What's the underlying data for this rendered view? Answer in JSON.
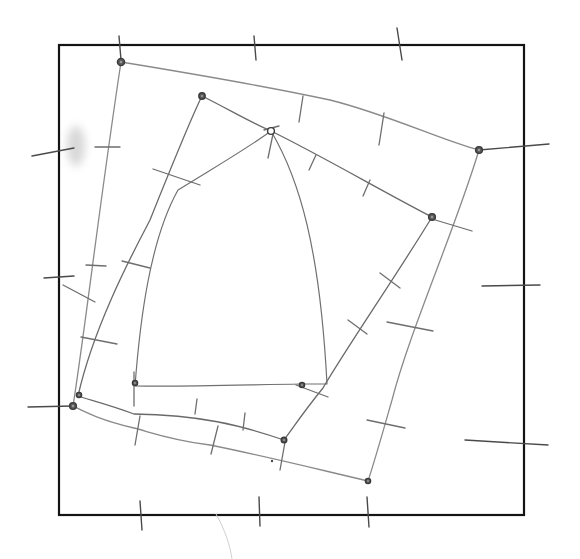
{
  "diagram": {
    "kind": "hand-drawn pencil sketch",
    "width": 580,
    "height": 559,
    "colors": {
      "background": "#ffffff",
      "frame": "#141414",
      "pencil_dark": "#4a4a4a",
      "pencil_mid": "#6e6e6e",
      "pencil_light": "#9a9a9a",
      "vertex_fill": "#5a5a5a",
      "smudge": "#b8b8b8"
    },
    "frame": {
      "x": 59,
      "y": 45,
      "width": 465,
      "height": 470,
      "stroke_width": 2.2
    },
    "quadrilaterals": [
      {
        "name": "outer-quad",
        "stroke": "#8a8a8a",
        "stroke_width": 1.3,
        "path": "M121,62 C170,70 260,85 330,100 C390,115 440,140 479,150 C455,230 410,330 392,400 C382,435 375,460 368,481 C300,465 260,455 210,445 C170,440 150,432 134,428 C100,420 85,412 73,406 C85,330 100,200 121,62 Z",
        "vertices": [
          [
            121,
            62
          ],
          [
            479,
            150
          ],
          [
            368,
            481
          ],
          [
            73,
            406
          ]
        ]
      },
      {
        "name": "middle-quad",
        "stroke": "#6a6a6a",
        "stroke_width": 1.3,
        "path": "M202,96 C230,110 250,122 271,131 C320,155 380,190 432,217 C400,270 345,350 323,388 C305,410 295,425 284,440 C240,425 200,415 134,414 C110,405 90,400 78,396 C95,320 140,240 150,220 C170,170 190,120 202,96 Z",
        "vertices": [
          [
            202,
            96
          ],
          [
            271,
            131
          ],
          [
            432,
            217
          ],
          [
            284,
            440
          ],
          [
            78,
            396
          ]
        ]
      },
      {
        "name": "inner-quad",
        "stroke": "#707070",
        "stroke_width": 1.2,
        "path": "M271,131 C300,180 320,250 327,384 L301,384 C240,385 180,387 135,386 C140,320 150,240 178,190 C210,170 245,150 271,131 Z",
        "vertices": [
          [
            271,
            131
          ],
          [
            327,
            384
          ],
          [
            301,
            384
          ],
          [
            135,
            386
          ],
          [
            178,
            190
          ]
        ]
      }
    ],
    "vertex_markers": [
      {
        "name": "vertex-outer-top-left",
        "x": 121,
        "y": 62,
        "r": 3.6
      },
      {
        "name": "vertex-middle-top",
        "x": 202,
        "y": 96,
        "r": 3.2
      },
      {
        "name": "vertex-apex",
        "x": 271,
        "y": 131,
        "r": 3.4,
        "hollow": true
      },
      {
        "name": "vertex-outer-right",
        "x": 479,
        "y": 150,
        "r": 3.4
      },
      {
        "name": "vertex-middle-right",
        "x": 432,
        "y": 217,
        "r": 3.4
      },
      {
        "name": "vertex-inner-bottom-right",
        "x": 302,
        "y": 385,
        "r": 2.6
      },
      {
        "name": "vertex-inner-bottom-left",
        "x": 135,
        "y": 383,
        "r": 2.6
      },
      {
        "name": "vertex-left-upper",
        "x": 79,
        "y": 395,
        "r": 2.6
      },
      {
        "name": "vertex-left-lower",
        "x": 73,
        "y": 406,
        "r": 3.4
      },
      {
        "name": "vertex-middle-bottom",
        "x": 284,
        "y": 440,
        "r": 2.8
      },
      {
        "name": "vertex-outer-bottom",
        "x": 368,
        "y": 481,
        "r": 2.6
      }
    ],
    "frame_ticks": [
      {
        "name": "tick-top-1",
        "x1": 119,
        "y1": 36,
        "x2": 121,
        "y2": 60
      },
      {
        "name": "tick-top-2",
        "x1": 254,
        "y1": 36,
        "x2": 256,
        "y2": 60
      },
      {
        "name": "tick-top-3",
        "x1": 397,
        "y1": 28,
        "x2": 402,
        "y2": 60
      },
      {
        "name": "tick-left-1",
        "x1": 32,
        "y1": 156,
        "x2": 74,
        "y2": 148
      },
      {
        "name": "tick-left-2",
        "x1": 44,
        "y1": 278,
        "x2": 74,
        "y2": 276
      },
      {
        "name": "tick-left-3",
        "x1": 28,
        "y1": 407,
        "x2": 73,
        "y2": 406
      },
      {
        "name": "tick-right-1",
        "x1": 482,
        "y1": 286,
        "x2": 540,
        "y2": 285
      },
      {
        "name": "tick-right-2",
        "x1": 465,
        "y1": 440,
        "x2": 548,
        "y2": 445
      },
      {
        "name": "tick-right-3",
        "x1": 479,
        "y1": 150,
        "x2": 549,
        "y2": 144
      },
      {
        "name": "tick-bottom-1",
        "x1": 140,
        "y1": 501,
        "x2": 142,
        "y2": 530
      },
      {
        "name": "tick-bottom-2",
        "x1": 259,
        "y1": 497,
        "x2": 260,
        "y2": 526
      },
      {
        "name": "tick-bottom-3",
        "x1": 367,
        "y1": 497,
        "x2": 369,
        "y2": 527
      }
    ],
    "edge_ticks": [
      {
        "name": "tick-outer-top-a",
        "x1": 303,
        "y1": 96,
        "x2": 299,
        "y2": 122
      },
      {
        "name": "tick-outer-top-b",
        "x1": 384,
        "y1": 113,
        "x2": 379,
        "y2": 145
      },
      {
        "name": "tick-middle-top-a",
        "x1": 316,
        "y1": 155,
        "x2": 309,
        "y2": 170
      },
      {
        "name": "tick-middle-top-b",
        "x1": 370,
        "y1": 180,
        "x2": 363,
        "y2": 196
      },
      {
        "name": "tick-middle-right-ext",
        "x1": 432,
        "y1": 219,
        "x2": 472,
        "y2": 231
      },
      {
        "name": "tick-apex-stub",
        "x1": 273,
        "y1": 134,
        "x2": 268,
        "y2": 158
      },
      {
        "name": "tick-apex-cross",
        "x1": 264,
        "y1": 130,
        "x2": 279,
        "y2": 126
      },
      {
        "name": "tick-left-outer-a",
        "x1": 95,
        "y1": 147,
        "x2": 120,
        "y2": 147
      },
      {
        "name": "tick-left-outer-b",
        "x1": 86,
        "y1": 265,
        "x2": 106,
        "y2": 266
      },
      {
        "name": "tick-left-middle-a",
        "x1": 153,
        "y1": 169,
        "x2": 200,
        "y2": 185
      },
      {
        "name": "tick-left-middle-b",
        "x1": 122,
        "y1": 261,
        "x2": 150,
        "y2": 268
      },
      {
        "name": "tick-left-loop",
        "x1": 81,
        "y1": 337,
        "x2": 117,
        "y2": 344
      },
      {
        "name": "tick-left-diag",
        "x1": 63,
        "y1": 285,
        "x2": 95,
        "y2": 302
      },
      {
        "name": "tick-right-outer-a",
        "x1": 387,
        "y1": 322,
        "x2": 433,
        "y2": 331
      },
      {
        "name": "tick-right-outer-b",
        "x1": 367,
        "y1": 420,
        "x2": 405,
        "y2": 428
      },
      {
        "name": "tick-right-middle-a",
        "x1": 380,
        "y1": 273,
        "x2": 400,
        "y2": 288
      },
      {
        "name": "tick-right-middle-b",
        "x1": 348,
        "y1": 320,
        "x2": 367,
        "y2": 334
      },
      {
        "name": "tick-inner-corner",
        "x1": 296,
        "y1": 385,
        "x2": 328,
        "y2": 397
      },
      {
        "name": "tick-bottom-middle-a",
        "x1": 197,
        "y1": 399,
        "x2": 195,
        "y2": 414
      },
      {
        "name": "tick-bottom-middle-b",
        "x1": 245,
        "y1": 413,
        "x2": 243,
        "y2": 430
      },
      {
        "name": "tick-bottom-outer-a",
        "x1": 140,
        "y1": 416,
        "x2": 135,
        "y2": 445
      },
      {
        "name": "tick-bottom-outer-b",
        "x1": 218,
        "y1": 426,
        "x2": 211,
        "y2": 454
      },
      {
        "name": "tick-bottom-inner-vert",
        "x1": 134,
        "y1": 372,
        "x2": 134,
        "y2": 406
      },
      {
        "name": "tick-middle-bottom-stub",
        "x1": 285,
        "y1": 442,
        "x2": 280,
        "y2": 470
      }
    ],
    "smudges": [
      {
        "name": "eraser-smudge",
        "cx": 76,
        "cy": 146,
        "rx": 9,
        "ry": 20
      }
    ],
    "stray_marks": [
      {
        "name": "stray-dot",
        "x": 272,
        "y": 461,
        "r": 1.2
      },
      {
        "name": "stray-line-bottom",
        "path": "M216,514 C225,530 230,545 232,559"
      }
    ]
  }
}
